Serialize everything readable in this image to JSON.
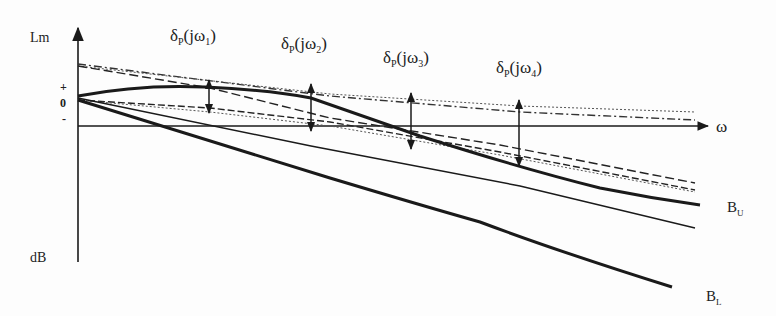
{
  "diagram": {
    "y_axis": {
      "label_top": "Lm",
      "label_bottom": "dB"
    },
    "x_axis": {
      "label": "ω"
    },
    "ticks": {
      "plus": "+",
      "zero": "0",
      "minus": "-"
    },
    "deltas": [
      {
        "symbol": "δ",
        "sub": "P",
        "arg": "(jω",
        "index": "1",
        "close": ")"
      },
      {
        "symbol": "δ",
        "sub": "P",
        "arg": "(jω",
        "index": "2",
        "close": ")"
      },
      {
        "symbol": "δ",
        "sub": "P",
        "arg": "(jω",
        "index": "3",
        "close": ")"
      },
      {
        "symbol": "δ",
        "sub": "P",
        "arg": "(jω",
        "index": "4",
        "close": ")"
      }
    ],
    "bounds": {
      "upper": {
        "main": "B",
        "sub": "U"
      },
      "lower": {
        "main": "B",
        "sub": "L"
      }
    },
    "colors": {
      "ink": "#1a1a1a",
      "background": "#fdfdfd"
    }
  }
}
